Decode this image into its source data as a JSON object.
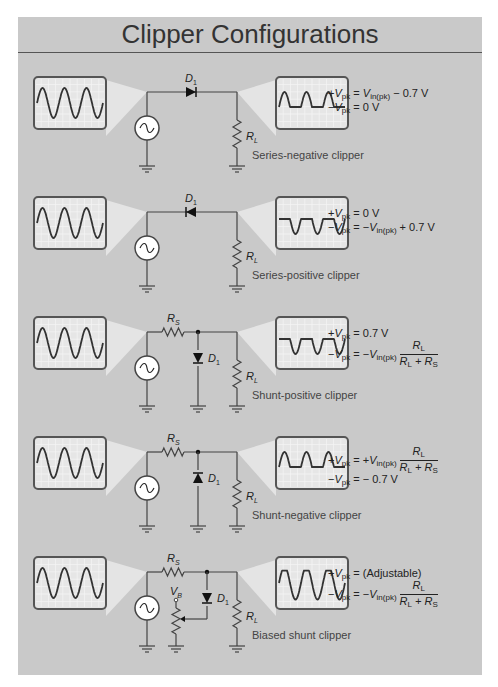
{
  "title": "Clipper Configurations",
  "colors": {
    "panel": "#c9c9c9",
    "wire": "#444444",
    "screen": "#e8e8e8",
    "grid": "#f4f4f4",
    "trace": "#333333"
  },
  "configs": [
    {
      "name": "Series-negative clipper",
      "type": "series",
      "diode_dir": "right",
      "output_wave": "clip-negative",
      "labels": {
        "diode": "D",
        "diode_sub": "1",
        "load": "R",
        "load_sub": "L"
      },
      "formula": {
        "pos": {
          "prefix": "+V",
          "sub": "pk",
          "eq": " = ",
          "rhs_v": "V",
          "rhs_sub": "in(pk)",
          "rhs_tail": " − 0.7 V"
        },
        "neg": {
          "prefix": "−V",
          "sub": "pk",
          "eq": " = 0 V"
        }
      }
    },
    {
      "name": "Series-positive clipper",
      "type": "series",
      "diode_dir": "left",
      "output_wave": "clip-positive",
      "labels": {
        "diode": "D",
        "diode_sub": "1",
        "load": "R",
        "load_sub": "L"
      },
      "formula": {
        "pos": {
          "prefix": "+V",
          "sub": "pk",
          "eq": " = 0 V"
        },
        "neg": {
          "prefix": "−V",
          "sub": "pk",
          "eq": " = −",
          "rhs_v": "V",
          "rhs_sub": "in(pk)",
          "rhs_tail": " + 0.7 V"
        }
      }
    },
    {
      "name": "Shunt-positive clipper",
      "type": "shunt",
      "diode_dir": "down",
      "output_wave": "clip-positive",
      "labels": {
        "series_r": "R",
        "series_r_sub": "S",
        "diode": "D",
        "diode_sub": "1",
        "load": "R",
        "load_sub": "L"
      },
      "formula": {
        "pos": {
          "prefix": "+V",
          "sub": "pk",
          "eq": " = 0.7 V"
        },
        "neg": {
          "prefix": "−V",
          "sub": "pk",
          "eq": " = −",
          "rhs_v": "V",
          "rhs_sub": "in(pk)",
          "frac_num": "R",
          "frac_num_sub": "L",
          "frac_den": "R",
          "frac_den_sub": "L",
          "frac_den2": " + R",
          "frac_den2_sub": "S"
        }
      }
    },
    {
      "name": "Shunt-negative clipper",
      "type": "shunt",
      "diode_dir": "up",
      "output_wave": "clip-negative",
      "labels": {
        "series_r": "R",
        "series_r_sub": "S",
        "diode": "D",
        "diode_sub": "1",
        "load": "R",
        "load_sub": "L"
      },
      "formula": {
        "pos": {
          "prefix": "+V",
          "sub": "pk",
          "eq": " = +",
          "rhs_v": "V",
          "rhs_sub": "in(pk)",
          "frac_num": "R",
          "frac_num_sub": "L",
          "frac_den": "R",
          "frac_den_sub": "L",
          "frac_den2": " + R",
          "frac_den2_sub": "S"
        },
        "neg": {
          "prefix": "−V",
          "sub": "pk",
          "eq": " = − 0.7 V"
        }
      }
    },
    {
      "name": "Biased shunt clipper",
      "type": "biased",
      "diode_dir": "down",
      "output_wave": "biased",
      "labels": {
        "series_r": "R",
        "series_r_sub": "S",
        "diode": "D",
        "diode_sub": "1",
        "load": "R",
        "load_sub": "L",
        "bias": "V",
        "bias_sub": "B"
      },
      "formula": {
        "pos": {
          "prefix": "+V",
          "sub": "pk",
          "eq": " = (Adjustable)"
        },
        "neg": {
          "prefix": "−V",
          "sub": "pk",
          "eq": " = −",
          "rhs_v": "V",
          "rhs_sub": "in(pk)",
          "frac_num": "R",
          "frac_num_sub": "L",
          "frac_den": "R",
          "frac_den_sub": "L",
          "frac_den2": " + R",
          "frac_den2_sub": "S"
        }
      }
    }
  ]
}
